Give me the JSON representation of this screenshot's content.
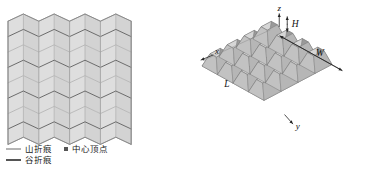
{
  "figure": {
    "panels": [
      {
        "id": "pattern",
        "kind": "2d-crease-pattern"
      },
      {
        "id": "folded",
        "kind": "3d-folded-structure"
      }
    ]
  },
  "legend": {
    "items": [
      {
        "key": "mountain",
        "label": "山折痕",
        "marker": "line",
        "color": "#b4b4b4"
      },
      {
        "key": "valley",
        "label": "谷折痕",
        "marker": "line",
        "color": "#555555"
      },
      {
        "key": "vertex",
        "label": "中心顶点",
        "marker": "dot",
        "color": "#555555"
      }
    ]
  },
  "pattern": {
    "columns": 4,
    "rows": 8,
    "fill": "#dcdcdc",
    "mountain_color": "#b4b4b4",
    "valley_color": "#6b6b6b",
    "outline_color": "#8a8a8a"
  },
  "model3d": {
    "axes": [
      {
        "name": "x-axis",
        "label": "x"
      },
      {
        "name": "y-axis",
        "label": "y"
      },
      {
        "name": "z-axis",
        "label": "z"
      }
    ],
    "dimensions": [
      {
        "name": "length",
        "label": "L"
      },
      {
        "name": "width",
        "label": "W"
      },
      {
        "name": "height",
        "label": "H"
      }
    ],
    "grid": {
      "cols": 4,
      "rows": 4
    },
    "colors": {
      "top": "#d6d6d6",
      "left": "#c2c2c2",
      "right": "#9a9a9a",
      "inner": "#8d8d8d",
      "edge": "#6f6f6f",
      "frame": "#7a7a7a"
    }
  }
}
